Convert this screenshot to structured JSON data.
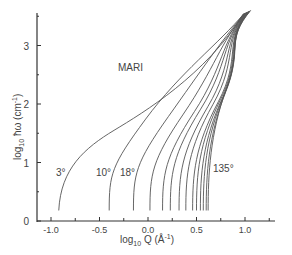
{
  "chart_data": {
    "type": "line",
    "title": "",
    "annotation": "MARI",
    "xlabel": "log10 Q (Å-1)",
    "ylabel": "log10 ħω (cm-1)",
    "xlim": [
      -1.15,
      1.3
    ],
    "ylim": [
      0,
      3.65
    ],
    "x_ticks": [
      -1.0,
      -0.5,
      0.0,
      0.5,
      1.0
    ],
    "x_tick_labels": [
      "-1.0",
      "-0.5",
      "0.0",
      "0.5",
      "1.0"
    ],
    "x_minor_ticks": [
      -0.75,
      -0.25,
      0.25,
      0.75,
      1.25
    ],
    "y_ticks": [
      0,
      1,
      2,
      3
    ],
    "y_tick_labels": [
      "0",
      "1",
      "2",
      "3"
    ],
    "y_minor_ticks": [
      0.5,
      1.5,
      2.5,
      3.5
    ],
    "grid": false,
    "legend": "none",
    "curve_labels": [
      {
        "text": "3°",
        "angle": 3
      },
      {
        "text": "10°",
        "angle": 10
      },
      {
        "text": "18°",
        "angle": 18
      },
      {
        "text": "135°",
        "angle": 135
      }
    ],
    "series": [
      {
        "name": "3°",
        "qmin": -0.92
      },
      {
        "name": "10°",
        "qmin": -0.4
      },
      {
        "name": "18°",
        "qmin": -0.15
      },
      {
        "name": "c4",
        "qmin": 0.02
      },
      {
        "name": "c5",
        "qmin": 0.15
      },
      {
        "name": "c6",
        "qmin": 0.23
      },
      {
        "name": "c7",
        "qmin": 0.32
      },
      {
        "name": "c8",
        "qmin": 0.39
      },
      {
        "name": "c9",
        "qmin": 0.46
      },
      {
        "name": "c10",
        "qmin": 0.5
      },
      {
        "name": "c11",
        "qmin": 0.54
      },
      {
        "name": "c12",
        "qmin": 0.57
      },
      {
        "name": "c13",
        "qmin": 0.6
      },
      {
        "name": "135°",
        "qmin": 0.62
      }
    ],
    "end_point": {
      "x": 1.1,
      "y": 3.6
    }
  },
  "labels": {
    "annotation": "MARI",
    "xlabel_main": "log",
    "xlabel_sub": "10",
    "xlabel_var": " Q  (Å",
    "xlabel_exp": "-1",
    "xlabel_close": ")",
    "ylabel_main": "log",
    "ylabel_sub": "10",
    "ylabel_var": " ħω  (cm",
    "ylabel_exp": "-1",
    "ylabel_close": ")",
    "label_3": "3°",
    "label_10": "10°",
    "label_18": "18°",
    "label_135": "135°"
  }
}
